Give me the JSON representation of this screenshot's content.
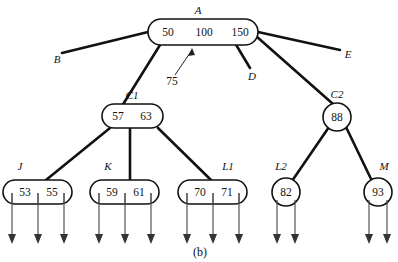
{
  "figure": {
    "caption": "(b)",
    "caption_name": "figure-caption"
  },
  "nodes": {
    "A": {
      "label": "A",
      "keys": [
        "50",
        "100",
        "150"
      ],
      "shape": "rounded-rect"
    },
    "C1": {
      "label": "C1",
      "keys": [
        "57",
        "63"
      ],
      "shape": "rounded-rect"
    },
    "C2": {
      "label": "C2",
      "keys": [
        "88"
      ],
      "shape": "circle"
    },
    "J": {
      "label": "J",
      "keys": [
        "53",
        "55"
      ],
      "shape": "rounded-rect"
    },
    "K": {
      "label": "K",
      "keys": [
        "59",
        "61"
      ],
      "shape": "rounded-rect"
    },
    "L1": {
      "label": "L1",
      "keys": [
        "70",
        "71"
      ],
      "shape": "rounded-rect"
    },
    "L2": {
      "label": "L2",
      "keys": [
        "82"
      ],
      "shape": "circle"
    },
    "M": {
      "label": "M",
      "keys": [
        "93"
      ],
      "shape": "circle"
    }
  },
  "annotations": {
    "pointer_75": "75",
    "pointer_B": "B",
    "pointer_D": "D",
    "pointer_E": "E"
  },
  "colors": {
    "ink": "#111111",
    "background": "#ffffff",
    "pointer": "#444444"
  }
}
